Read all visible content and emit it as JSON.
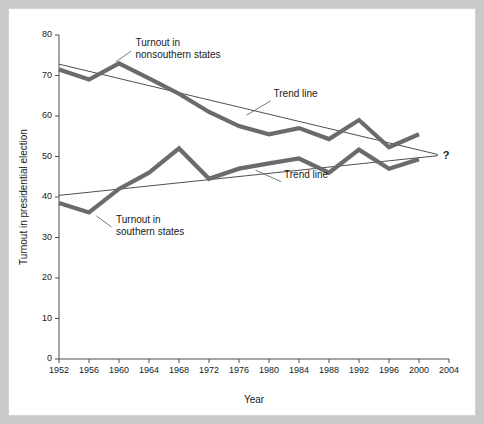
{
  "chart_data": {
    "type": "line",
    "title": "",
    "xlabel": "Year",
    "ylabel": "Turnout in presidential election",
    "xlim": [
      1952,
      2004
    ],
    "ylim": [
      0,
      80
    ],
    "grid": false,
    "legend_position": "inline-annotations",
    "x": [
      1952,
      1956,
      1960,
      1964,
      1968,
      1972,
      1976,
      1980,
      1984,
      1988,
      1992,
      1996,
      2000
    ],
    "x_tick_labels": [
      "1952",
      "1956",
      "1960",
      "1964",
      "1968",
      "1972",
      "1976",
      "1980",
      "1984",
      "1988",
      "1992",
      "1996",
      "2000",
      "2004"
    ],
    "x_ticks": [
      1952,
      1956,
      1960,
      1964,
      1968,
      1972,
      1976,
      1980,
      1984,
      1988,
      1992,
      1996,
      2000,
      2004
    ],
    "y_tick_labels": [
      "0",
      "10",
      "20",
      "30",
      "40",
      "50",
      "60",
      "70",
      "80"
    ],
    "y_ticks": [
      0,
      10,
      20,
      30,
      40,
      50,
      60,
      70,
      80
    ],
    "series": [
      {
        "name": "Turnout in nonsouthern states",
        "color": "#6b6b6b",
        "values": [
          71.5,
          69.0,
          73.0,
          69.3,
          65.5,
          61.0,
          57.5,
          55.5,
          57.0,
          54.3,
          59.0,
          52.3,
          55.5
        ]
      },
      {
        "name": "Turnout in southern states",
        "color": "#6b6b6b",
        "values": [
          38.5,
          36.2,
          42.0,
          46.0,
          52.0,
          44.5,
          47.0,
          48.3,
          49.5,
          46.0,
          51.7,
          47.0,
          49.3
        ]
      }
    ],
    "trend_lines": [
      {
        "name": "Trend line (nonsouthern)",
        "color": "#3a3a3a",
        "x_start": 1952,
        "y_start": 72.8,
        "x_end": 2002.5,
        "y_end": 50.5
      },
      {
        "name": "Trend line (southern)",
        "color": "#3a3a3a",
        "x_start": 1952,
        "y_start": 40.4,
        "x_end": 2002.5,
        "y_end": 50.2
      }
    ],
    "annotations": [
      {
        "id": "nonsouthern-label",
        "lines": [
          "Turnout in",
          "nonsouthern states"
        ],
        "text_x": 1962.2,
        "text_y": 77.2,
        "leader_from_x": 1961.6,
        "leader_from_y": 76.0,
        "leader_to_x": 1959.6,
        "leader_to_y": 73.4
      },
      {
        "id": "trend-line-upper-label",
        "lines": [
          "Trend line"
        ],
        "text_x": 1980.6,
        "text_y": 64.6,
        "leader_from_x": 1980.2,
        "leader_from_y": 63.7,
        "leader_to_x": 1977.0,
        "leader_to_y": 60.2
      },
      {
        "id": "trend-line-lower-label",
        "lines": [
          "Trend line"
        ],
        "text_x": 1982.0,
        "text_y": 44.6,
        "leader_from_x": 1981.6,
        "leader_from_y": 43.8,
        "leader_to_x": 1978.2,
        "leader_to_y": 46.6
      },
      {
        "id": "southern-label",
        "lines": [
          "Turnout in",
          "southern states"
        ],
        "text_x": 1959.6,
        "text_y": 33.6,
        "leader_from_x": 1959.0,
        "leader_from_y": 32.6,
        "leader_to_x": 1957.0,
        "leader_to_y": 35.3
      }
    ],
    "question_marker": {
      "label": "?",
      "x": 2003.6,
      "y": 50.3
    }
  },
  "colors": {
    "page_background": "#c9c9c9",
    "panel_background": "#ffffff",
    "series_gray": "#6b6b6b",
    "trend_dark": "#3a3a3a",
    "axis": "#4d4d4d",
    "text": "#1a1a1a"
  }
}
